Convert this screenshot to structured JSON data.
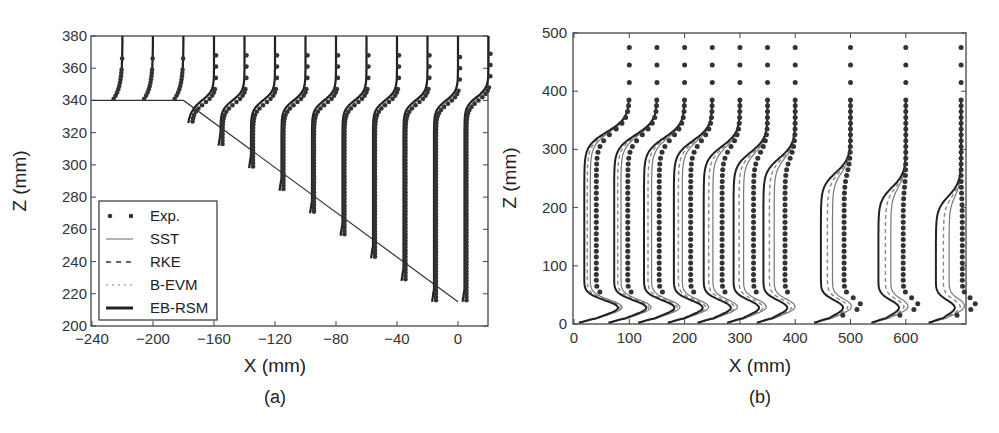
{
  "chart_data": [
    {
      "id": "a",
      "type": "line",
      "caption": "(a)",
      "xlabel": "X (mm)",
      "ylabel": "Z (mm)",
      "xlim": [
        -240,
        20
      ],
      "ylim": [
        200,
        380
      ],
      "xticks": [
        -240,
        -200,
        -160,
        -120,
        -80,
        -40,
        0
      ],
      "xtick_labels": [
        "−240",
        "−200",
        "−160",
        "−120",
        "−80",
        "−40",
        "0"
      ],
      "yticks": [
        200,
        220,
        240,
        260,
        280,
        300,
        320,
        340,
        360,
        380
      ],
      "grid": false,
      "legend": {
        "position": "lower-left",
        "entries": [
          {
            "label": "Exp.",
            "style": "dots"
          },
          {
            "label": "SST",
            "style": "thin-solid-gray"
          },
          {
            "label": "RKE",
            "style": "dashed"
          },
          {
            "label": "B-EVM",
            "style": "dotted-light"
          },
          {
            "label": "EB-RSM",
            "style": "thick-solid"
          }
        ]
      },
      "geometry": {
        "step": [
          [
            -240,
            340
          ],
          [
            -180,
            340
          ],
          [
            0,
            215
          ]
        ]
      },
      "profile_stations_x": [
        -220,
        -200,
        -180,
        -160,
        -140,
        -120,
        -100,
        -80,
        -60,
        -40,
        -20,
        0,
        20
      ],
      "profile_wall_z": [
        340,
        340,
        340,
        326,
        312,
        298,
        284,
        270,
        256,
        242,
        228,
        215,
        215
      ],
      "profile_shear_z": [
        352,
        352,
        352,
        340,
        340,
        340,
        340,
        340,
        340,
        340,
        340,
        340,
        342
      ]
    },
    {
      "id": "b",
      "type": "line",
      "caption": "(b)",
      "xlabel": "X (mm)",
      "ylabel": "Z (mm)",
      "xlim": [
        0,
        710
      ],
      "ylim": [
        0,
        500
      ],
      "xticks": [
        0,
        100,
        200,
        300,
        400,
        500,
        600
      ],
      "xtick_labels": [
        "0",
        "100",
        "200",
        "300",
        "400",
        "500",
        "600"
      ],
      "yticks": [
        0,
        100,
        200,
        300,
        400,
        500
      ],
      "grid": false,
      "profile_stations_x": [
        100,
        150,
        200,
        250,
        300,
        350,
        400,
        500,
        600,
        700
      ],
      "profile_shear_z": [
        330,
        325,
        320,
        315,
        305,
        295,
        285,
        260,
        235,
        220
      ]
    }
  ],
  "legend_labels": [
    "Exp.",
    "SST",
    "RKE",
    "B-EVM",
    "EB-RSM"
  ],
  "captions": {
    "a": "(a)",
    "b": "(b)"
  },
  "axis_labels": {
    "x": "X (mm)",
    "z": "Z (mm)"
  }
}
